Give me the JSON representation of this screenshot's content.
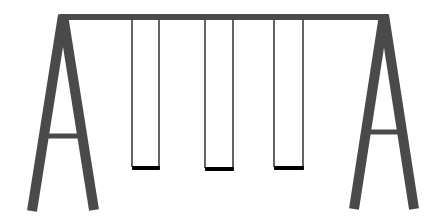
{
  "scene": {
    "subject": "swing set",
    "background_color": "#ffffff",
    "frame_color": "#4a4a4a",
    "rope_color": "#222222",
    "seat_color": "#000000",
    "frame": {
      "top_beam": {
        "x1": 60,
        "x2": 388,
        "y": 17,
        "thickness": 6
      },
      "left_a_frame": {
        "apex": [
          63,
          15
        ],
        "left_foot": [
          32,
          211
        ],
        "right_foot": [
          94,
          210
        ],
        "crossbar": {
          "y": 136,
          "x1": 46,
          "x2": 81,
          "thickness": 5
        }
      },
      "right_a_frame": {
        "apex": [
          384,
          15
        ],
        "left_foot": [
          354,
          209
        ],
        "right_foot": [
          414,
          209
        ],
        "crossbar": {
          "y": 132,
          "x1": 368,
          "x2": 403,
          "thickness": 5
        }
      },
      "leg_thickness": 10
    },
    "swings": [
      {
        "left_rope_x": 132,
        "right_rope_x": 159,
        "seat_y": 166
      },
      {
        "left_rope_x": 205,
        "right_rope_x": 233,
        "seat_y": 167
      },
      {
        "left_rope_x": 274,
        "right_rope_x": 303,
        "seat_y": 166
      }
    ]
  }
}
